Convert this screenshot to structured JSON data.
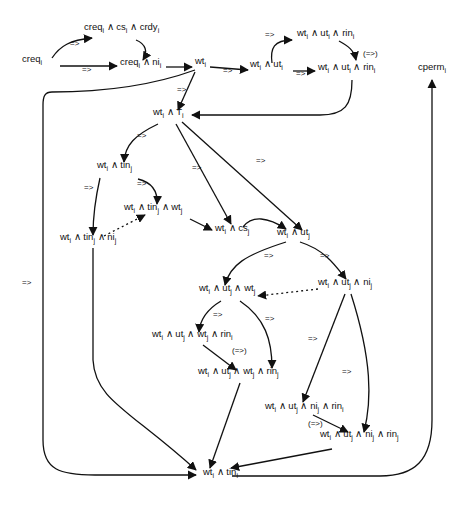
{
  "nodes": [
    {
      "id": "n1",
      "label": "creq_i",
      "x": 22,
      "y": 62
    },
    {
      "id": "n2",
      "label": "creq_i ∧ cs_i ∧ crdy_i",
      "x": 84,
      "y": 30
    },
    {
      "id": "n3",
      "label": "creq_i ∧ ni_i",
      "x": 120,
      "y": 65
    },
    {
      "id": "n4",
      "label": "wt_i",
      "x": 195,
      "y": 64
    },
    {
      "id": "n5",
      "label": "wt_i ∧ ut_i",
      "x": 250,
      "y": 67
    },
    {
      "id": "n6",
      "label": "wt_i ∧ ut_i ∧ rin_i",
      "x": 297,
      "y": 36
    },
    {
      "id": "n7",
      "label": "wt_i ∧ ut_i ∧ rin_i",
      "x": 318,
      "y": 70
    },
    {
      "id": "n8",
      "label": "cperm_i",
      "x": 418,
      "y": 70
    },
    {
      "id": "n9",
      "label": "wt_i ∧ T_i",
      "x": 153,
      "y": 115
    },
    {
      "id": "n10",
      "label": "wt_i ∧ tin_j",
      "x": 97,
      "y": 168
    },
    {
      "id": "n11",
      "label": "wt_i ∧ tin_j ∧ wt_j",
      "x": 124,
      "y": 210
    },
    {
      "id": "n12",
      "label": "wt_i ∧ tin_j ∧ ni_j",
      "x": 60,
      "y": 240
    },
    {
      "id": "n13",
      "label": "wt_i ∧ cs_j",
      "x": 215,
      "y": 231
    },
    {
      "id": "n14",
      "label": "wt_i ∧ ut_j",
      "x": 277,
      "y": 235
    },
    {
      "id": "n15",
      "label": "wt_i ∧ ut_j ∧ wt_j",
      "x": 199,
      "y": 291
    },
    {
      "id": "n16",
      "label": "wt_i ∧ ut_j ∧ ni_j",
      "x": 318,
      "y": 285
    },
    {
      "id": "n17",
      "label": "wt_i ∧ ut_j ∧ wt_j ∧ rin_i",
      "x": 152,
      "y": 337
    },
    {
      "id": "n18",
      "label": "wt_i ∧ ut_j ∧ wt_j ∧ rin_j",
      "x": 198,
      "y": 374
    },
    {
      "id": "n19",
      "label": "wt_i ∧ ut_j ∧ ni_j ∧ rin_i",
      "x": 265,
      "y": 409
    },
    {
      "id": "n20",
      "label": "wt_i ∧ ut_j ∧ ni_j ∧ rin_j",
      "x": 320,
      "y": 437
    },
    {
      "id": "n21",
      "label": "wt_i ∧ tin_i",
      "x": 203,
      "y": 475
    }
  ],
  "edge_labels": [
    {
      "text": "=>",
      "x": 70,
      "y": 45
    },
    {
      "text": "=>",
      "x": 82,
      "y": 71
    },
    {
      "text": "=>",
      "x": 177,
      "y": 91
    },
    {
      "text": "=>",
      "x": 223,
      "y": 72
    },
    {
      "text": "=>",
      "x": 265,
      "y": 36
    },
    {
      "text": "=>",
      "x": 296,
      "y": 75
    },
    {
      "text": "(=>)",
      "x": 363,
      "y": 55
    },
    {
      "text": "=>",
      "x": 137,
      "y": 137
    },
    {
      "text": "=>",
      "x": 192,
      "y": 169
    },
    {
      "text": "=>",
      "x": 256,
      "y": 162
    },
    {
      "text": "=>",
      "x": 84,
      "y": 189
    },
    {
      "text": "=>",
      "x": 137,
      "y": 185
    },
    {
      "text": "=>",
      "x": 264,
      "y": 257
    },
    {
      "text": "=>",
      "x": 320,
      "y": 257
    },
    {
      "text": "=>",
      "x": 22,
      "y": 284
    },
    {
      "text": "=>",
      "x": 213,
      "y": 316
    },
    {
      "text": "=>",
      "x": 265,
      "y": 320
    },
    {
      "text": "=>",
      "x": 308,
      "y": 340
    },
    {
      "text": "(=>)",
      "x": 232,
      "y": 352
    },
    {
      "text": "=>",
      "x": 342,
      "y": 373
    },
    {
      "text": "(=>)",
      "x": 308,
      "y": 425
    }
  ],
  "edges": [
    {
      "id": "e1",
      "d": "M52 58 C60 46, 70 40, 92 38",
      "style": "solid"
    },
    {
      "id": "e2",
      "d": "M60 66 L117 66",
      "style": "solid"
    },
    {
      "id": "e3",
      "d": "M136 40 C146 44, 148 52, 143 60",
      "style": "solid"
    },
    {
      "id": "e4",
      "d": "M166 67 L192 67",
      "style": "solid"
    },
    {
      "id": "e5",
      "d": "M210 67 L248 70",
      "style": "solid"
    },
    {
      "id": "e6",
      "d": "M272 63 C270 48, 274 40, 292 40",
      "style": "solid"
    },
    {
      "id": "e7",
      "d": "M293 71 L315 71",
      "style": "solid"
    },
    {
      "id": "e8",
      "d": "M339 41 C348 46, 354 50, 356 60",
      "style": "solid"
    },
    {
      "id": "e9",
      "d": "M352 80 C352 105, 345 115, 320 115 L192 115",
      "style": "solid"
    },
    {
      "id": "e10",
      "d": "M195 72 L178 110",
      "style": "solid"
    },
    {
      "id": "e11",
      "d": "M195 70 C140 90, 80 92, 52 92 C45 92, 43 96, 43 105 L43 440 C43 470, 60 475, 95 475 L196 475",
      "style": "solid"
    },
    {
      "id": "e12",
      "d": "M158 124 C135 135, 125 145, 124 162",
      "style": "solid"
    },
    {
      "id": "e13",
      "d": "M176 124 L231 224",
      "style": "solid"
    },
    {
      "id": "e14",
      "d": "M182 122 L302 230",
      "style": "solid"
    },
    {
      "id": "e15",
      "d": "M138 179 C150 182, 158 190, 157 204",
      "style": "solid"
    },
    {
      "id": "e16",
      "d": "M100 178 C95 200, 93 215, 93 235",
      "style": "solid"
    },
    {
      "id": "e17",
      "d": "M104 236 L145 215",
      "style": "dashed"
    },
    {
      "id": "e18",
      "d": "M190 219 L212 230",
      "style": "solid"
    },
    {
      "id": "e19",
      "d": "M243 227 C252 215, 268 217, 286 229",
      "style": "solid"
    },
    {
      "id": "e20",
      "d": "M286 242 C245 255, 230 265, 225 285",
      "style": "solid"
    },
    {
      "id": "e21",
      "d": "M300 242 C325 250, 335 265, 346 279",
      "style": "solid"
    },
    {
      "id": "e22",
      "d": "M318 289 L258 296",
      "style": "dashed"
    },
    {
      "id": "e23",
      "d": "M221 301 C206 310, 200 320, 199 332",
      "style": "solid"
    },
    {
      "id": "e24",
      "d": "M240 301 C265 318, 272 340, 272 368",
      "style": "solid"
    },
    {
      "id": "e25",
      "d": "M203 345 L236 370",
      "style": "solid"
    },
    {
      "id": "e26",
      "d": "M240 383 L210 468",
      "style": "solid"
    },
    {
      "id": "e27",
      "d": "M345 294 L303 402",
      "style": "solid"
    },
    {
      "id": "e28",
      "d": "M351 294 C372 360, 372 400, 364 432",
      "style": "solid"
    },
    {
      "id": "e29",
      "d": "M313 415 L348 432",
      "style": "solid"
    },
    {
      "id": "e30",
      "d": "M332 449 L231 468",
      "style": "solid"
    },
    {
      "id": "e31",
      "d": "M232 476 L380 476 C415 476, 432 460, 432 420 L432 80",
      "style": "solid"
    },
    {
      "id": "e32",
      "d": "M93 248 L93 360 C95 400, 130 410, 196 470",
      "style": "solid"
    }
  ]
}
